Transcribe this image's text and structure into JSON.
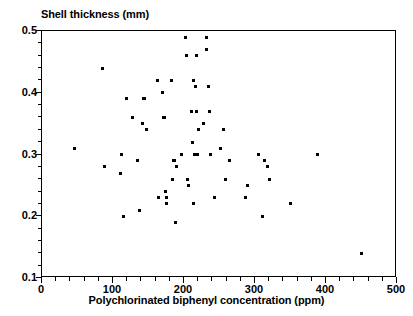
{
  "chart_data": {
    "type": "scatter",
    "title": "",
    "ylabel": "Shell thickness (mm)",
    "xlabel": "Polychlorinated biphenyl concentration (ppm)",
    "xlim": [
      0,
      500
    ],
    "ylim": [
      0.1,
      0.5
    ],
    "xticks": [
      0,
      100,
      200,
      300,
      400,
      500
    ],
    "xtick_labels": [
      "0",
      "100",
      "200",
      "300",
      "400",
      "500"
    ],
    "yticks": [
      0.1,
      0.2,
      0.3,
      0.4,
      0.5
    ],
    "ytick_labels": [
      "0.1",
      "0.2",
      "0.3",
      "0.4",
      "0.5"
    ],
    "x_minor_tick_interval": 20,
    "y_minor_tick_interval": 0.02,
    "grid": false,
    "legend": null,
    "marker": "square",
    "marker_color": "#000000",
    "marker_size_px": 3,
    "n_points": 65,
    "points": [
      [
        46,
        0.31
      ],
      [
        85,
        0.44
      ],
      [
        88,
        0.28
      ],
      [
        110,
        0.27
      ],
      [
        112,
        0.3
      ],
      [
        115,
        0.2
      ],
      [
        119,
        0.39
      ],
      [
        127,
        0.36
      ],
      [
        135,
        0.29
      ],
      [
        138,
        0.21
      ],
      [
        141,
        0.35
      ],
      [
        143,
        0.39
      ],
      [
        145,
        0.39
      ],
      [
        147,
        0.34
      ],
      [
        163,
        0.42
      ],
      [
        164,
        0.23
      ],
      [
        170,
        0.4
      ],
      [
        171,
        0.36
      ],
      [
        173,
        0.36
      ],
      [
        174,
        0.24
      ],
      [
        175,
        0.23
      ],
      [
        176,
        0.22
      ],
      [
        183,
        0.42
      ],
      [
        184,
        0.26
      ],
      [
        185,
        0.29
      ],
      [
        186,
        0.29
      ],
      [
        187,
        0.29
      ],
      [
        188,
        0.19
      ],
      [
        190,
        0.28
      ],
      [
        197,
        0.3
      ],
      [
        202,
        0.49
      ],
      [
        204,
        0.46
      ],
      [
        205,
        0.26
      ],
      [
        206,
        0.25
      ],
      [
        210,
        0.37
      ],
      [
        212,
        0.32
      ],
      [
        213,
        0.22
      ],
      [
        214,
        0.42
      ],
      [
        215,
        0.3
      ],
      [
        216,
        0.41
      ],
      [
        217,
        0.46
      ],
      [
        218,
        0.37
      ],
      [
        219,
        0.3
      ],
      [
        221,
        0.34
      ],
      [
        228,
        0.35
      ],
      [
        231,
        0.49
      ],
      [
        232,
        0.47
      ],
      [
        234,
        0.41
      ],
      [
        236,
        0.37
      ],
      [
        237,
        0.3
      ],
      [
        243,
        0.23
      ],
      [
        252,
        0.31
      ],
      [
        255,
        0.34
      ],
      [
        258,
        0.26
      ],
      [
        264,
        0.29
      ],
      [
        286,
        0.23
      ],
      [
        290,
        0.25
      ],
      [
        305,
        0.3
      ],
      [
        310,
        0.2
      ],
      [
        314,
        0.29
      ],
      [
        318,
        0.28
      ],
      [
        320,
        0.26
      ],
      [
        350,
        0.22
      ],
      [
        388,
        0.3
      ],
      [
        450,
        0.14
      ]
    ]
  },
  "axes": {
    "y_title": "Shell thickness (mm)",
    "x_title": "Polychlorinated biphenyl concentration (ppm)"
  }
}
